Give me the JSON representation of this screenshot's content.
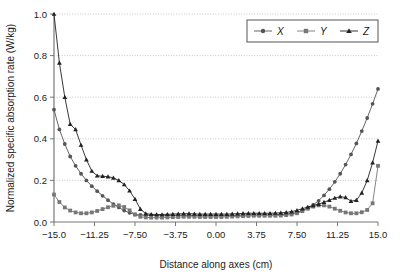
{
  "chart_data": {
    "type": "line",
    "title": "",
    "xlabel": "Distance along axes (cm)",
    "ylabel": "Normalized specific absorption rate (W/kg)",
    "xlim": [
      -15.0,
      15.0
    ],
    "ylim": [
      0.0,
      1.0
    ],
    "xticks": [
      -15.0,
      -11.25,
      -7.5,
      -3.75,
      0.0,
      3.75,
      7.5,
      11.25,
      15.0
    ],
    "xtick_labels": [
      "−15.0",
      "−11.25",
      "−7.50",
      "−3.75",
      "0.00",
      "3.75",
      "7.50",
      "11.25",
      "15.0"
    ],
    "yticks": [
      0.0,
      0.2,
      0.4,
      0.6,
      0.8,
      1.0
    ],
    "ytick_labels": [
      "0.0",
      "0.2",
      "0.4",
      "0.6",
      "0.8",
      "1.0"
    ],
    "grid": true,
    "grid_axis": "y",
    "grid_color": "#bbbbbb",
    "legend_position": "top-right",
    "legend_entries": [
      {
        "name": "X",
        "marker": "circle",
        "color": "#555555"
      },
      {
        "name": "Y",
        "marker": "square",
        "color": "#777777"
      },
      {
        "name": "Z",
        "marker": "triangle",
        "color": "#222222"
      }
    ],
    "x": [
      -15.0,
      -14.5,
      -14.0,
      -13.5,
      -13.0,
      -12.5,
      -12.0,
      -11.5,
      -11.0,
      -10.5,
      -10.0,
      -9.5,
      -9.0,
      -8.5,
      -8.0,
      -7.5,
      -7.0,
      -6.5,
      -6.0,
      -5.5,
      -5.0,
      -4.5,
      -4.0,
      -3.5,
      -3.0,
      -2.5,
      -2.0,
      -1.5,
      -1.0,
      -0.5,
      0.0,
      0.5,
      1.0,
      1.5,
      2.0,
      2.5,
      3.0,
      3.5,
      4.0,
      4.5,
      5.0,
      5.5,
      6.0,
      6.5,
      7.0,
      7.5,
      8.0,
      8.5,
      9.0,
      9.5,
      10.0,
      10.5,
      11.0,
      11.5,
      12.0,
      12.5,
      13.0,
      13.5,
      14.0,
      14.5,
      15.0
    ],
    "series": [
      {
        "name": "X",
        "marker": "circle",
        "color": "#555555",
        "values": [
          0.54,
          0.445,
          0.375,
          0.315,
          0.27,
          0.232,
          0.2,
          0.172,
          0.148,
          0.126,
          0.105,
          0.086,
          0.07,
          0.055,
          0.044,
          0.036,
          0.034,
          0.033,
          0.032,
          0.031,
          0.03,
          0.03,
          0.031,
          0.032,
          0.032,
          0.032,
          0.031,
          0.03,
          0.03,
          0.03,
          0.03,
          0.03,
          0.03,
          0.031,
          0.032,
          0.033,
          0.034,
          0.034,
          0.034,
          0.034,
          0.034,
          0.035,
          0.036,
          0.038,
          0.041,
          0.046,
          0.055,
          0.066,
          0.082,
          0.102,
          0.128,
          0.158,
          0.193,
          0.232,
          0.276,
          0.325,
          0.378,
          0.437,
          0.5,
          0.568,
          0.64
        ]
      },
      {
        "name": "Y",
        "marker": "square",
        "color": "#777777",
        "values": [
          0.132,
          0.096,
          0.07,
          0.055,
          0.046,
          0.042,
          0.042,
          0.046,
          0.053,
          0.062,
          0.071,
          0.078,
          0.08,
          0.072,
          0.056,
          0.036,
          0.025,
          0.022,
          0.021,
          0.021,
          0.021,
          0.022,
          0.023,
          0.024,
          0.025,
          0.025,
          0.025,
          0.024,
          0.024,
          0.024,
          0.024,
          0.024,
          0.025,
          0.026,
          0.027,
          0.028,
          0.029,
          0.03,
          0.03,
          0.03,
          0.03,
          0.03,
          0.031,
          0.033,
          0.036,
          0.042,
          0.052,
          0.064,
          0.074,
          0.08,
          0.08,
          0.074,
          0.064,
          0.054,
          0.046,
          0.042,
          0.042,
          0.047,
          0.058,
          0.09,
          0.27
        ]
      },
      {
        "name": "Z",
        "marker": "triangle",
        "color": "#222222",
        "values": [
          1.0,
          0.765,
          0.6,
          0.47,
          0.445,
          0.37,
          0.3,
          0.245,
          0.222,
          0.22,
          0.218,
          0.212,
          0.2,
          0.18,
          0.15,
          0.11,
          0.062,
          0.04,
          0.037,
          0.036,
          0.036,
          0.037,
          0.038,
          0.039,
          0.04,
          0.04,
          0.039,
          0.038,
          0.038,
          0.038,
          0.038,
          0.038,
          0.038,
          0.039,
          0.04,
          0.041,
          0.042,
          0.042,
          0.042,
          0.042,
          0.042,
          0.043,
          0.044,
          0.046,
          0.05,
          0.056,
          0.064,
          0.072,
          0.08,
          0.086,
          0.095,
          0.105,
          0.115,
          0.122,
          0.118,
          0.1,
          0.105,
          0.14,
          0.2,
          0.285,
          0.39
        ]
      }
    ]
  }
}
